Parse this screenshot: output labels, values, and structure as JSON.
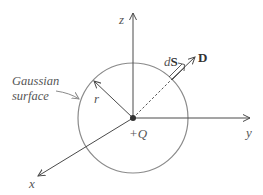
{
  "diagram": {
    "colors": {
      "axis": "#4a4a4a",
      "circle": "#8a8a8a",
      "text": "#555555",
      "charge": "#333333"
    },
    "labels": {
      "z_axis": "z",
      "y_axis": "y",
      "x_axis": "x",
      "surface_line1": "Gaussian",
      "surface_line2": "surface",
      "radius": "r",
      "charge": "+Q",
      "dS_d": "d",
      "dS_S": "S",
      "D": "D"
    },
    "geometry": {
      "origin": [
        133,
        118
      ],
      "circle_radius": 55
    }
  }
}
